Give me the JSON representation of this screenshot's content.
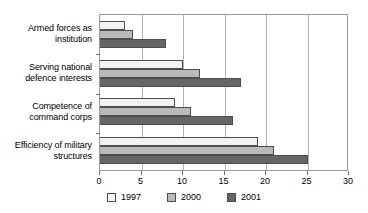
{
  "chart_data": {
    "type": "bar",
    "orientation": "horizontal",
    "title": "",
    "xlabel": "",
    "ylabel": "",
    "xlim": [
      0,
      30
    ],
    "xticks": [
      0,
      5,
      10,
      15,
      20,
      25,
      30
    ],
    "grid": true,
    "legend_position": "bottom",
    "categories": [
      "Armed forces as\ninstitution",
      "Serving national\ndefence interests",
      "Competence of\ncommand corps",
      "Efficiency of military\nstructures"
    ],
    "series": [
      {
        "name": "1997",
        "color": "#f2f2f2",
        "values": [
          3,
          10,
          9,
          19
        ]
      },
      {
        "name": "2000",
        "color": "#b9b9b9",
        "values": [
          4,
          12,
          11,
          21
        ]
      },
      {
        "name": "2001",
        "color": "#656565",
        "values": [
          8,
          17,
          16,
          25
        ]
      }
    ]
  },
  "legend": {
    "items": [
      {
        "label": "1997"
      },
      {
        "label": "2000"
      },
      {
        "label": "2001"
      }
    ]
  },
  "axis": {
    "tick_labels": [
      "0",
      "5",
      "10",
      "15",
      "20",
      "25",
      "30"
    ]
  }
}
